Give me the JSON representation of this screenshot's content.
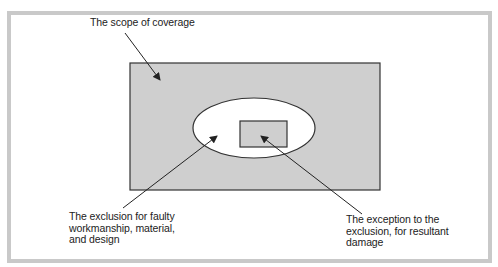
{
  "figure": {
    "partial_caption": "...coverage",
    "colors": {
      "frame": "#c9c9c9",
      "scope_fill": "#cfcfcf",
      "exclusion_fill": "#ffffff",
      "exception_fill": "#cfcfcf",
      "stroke": "#333333"
    }
  },
  "labels": {
    "scope": "The scope of coverage",
    "exclusion": "The exclusion for faulty workmanship, material, and design",
    "exception": "The exception to the exclusion, for resultant damage"
  }
}
